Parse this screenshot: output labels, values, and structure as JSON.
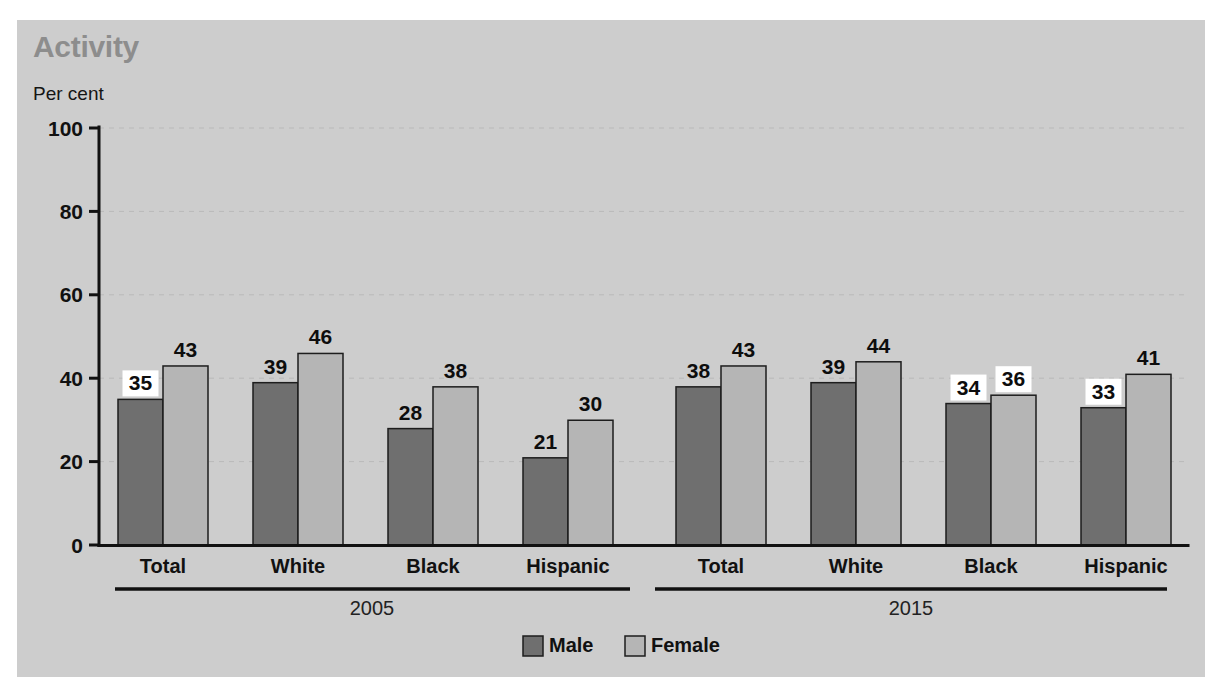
{
  "chart_data": {
    "type": "bar",
    "title": "Activity",
    "subtitle": "",
    "ylabel": "Per cent",
    "xlabel": "",
    "ylim": [
      0,
      100
    ],
    "yticks": [
      0,
      20,
      40,
      60,
      80,
      100
    ],
    "ytick_labels": [
      "0",
      "20",
      "40",
      "60",
      "80",
      "100"
    ],
    "grid": true,
    "grid_axis": "y",
    "legend_position": "bottom-center",
    "categories": [
      "Total",
      "White",
      "Black",
      "Hispanic",
      "Total",
      "White",
      "Black",
      "Hispanic"
    ],
    "groups": [
      {
        "period": "2005",
        "categories": [
          "Total",
          "White",
          "Black",
          "Hispanic"
        ]
      },
      {
        "period": "2015",
        "categories": [
          "Total",
          "White",
          "Black",
          "Hispanic"
        ]
      }
    ],
    "series": [
      {
        "name": "Male",
        "color": "#6f6f6f",
        "values": [
          35,
          39,
          28,
          21,
          38,
          39,
          34,
          33
        ]
      },
      {
        "name": "Female",
        "color": "#b5b5b5",
        "values": [
          43,
          46,
          38,
          30,
          43,
          44,
          36,
          41
        ]
      }
    ],
    "data_labels": [
      {
        "group": 0,
        "category": "Total",
        "period": "2005",
        "series": "Male",
        "value": 35,
        "boxed": true
      },
      {
        "group": 0,
        "category": "Total",
        "period": "2005",
        "series": "Female",
        "value": 43,
        "boxed": false
      },
      {
        "group": 0,
        "category": "White",
        "period": "2005",
        "series": "Male",
        "value": 39,
        "boxed": false
      },
      {
        "group": 0,
        "category": "White",
        "period": "2005",
        "series": "Female",
        "value": 46,
        "boxed": false
      },
      {
        "group": 0,
        "category": "Black",
        "period": "2005",
        "series": "Male",
        "value": 28,
        "boxed": false
      },
      {
        "group": 0,
        "category": "Black",
        "period": "2005",
        "series": "Female",
        "value": 38,
        "boxed": false
      },
      {
        "group": 0,
        "category": "Hispanic",
        "period": "2005",
        "series": "Male",
        "value": 21,
        "boxed": false
      },
      {
        "group": 0,
        "category": "Hispanic",
        "period": "2005",
        "series": "Female",
        "value": 30,
        "boxed": false
      },
      {
        "group": 1,
        "category": "Total",
        "period": "2015",
        "series": "Male",
        "value": 38,
        "boxed": false
      },
      {
        "group": 1,
        "category": "Total",
        "period": "2015",
        "series": "Female",
        "value": 43,
        "boxed": false
      },
      {
        "group": 1,
        "category": "White",
        "period": "2015",
        "series": "Male",
        "value": 39,
        "boxed": false
      },
      {
        "group": 1,
        "category": "White",
        "period": "2015",
        "series": "Female",
        "value": 44,
        "boxed": false
      },
      {
        "group": 1,
        "category": "Black",
        "period": "2015",
        "series": "Male",
        "value": 34,
        "boxed": true
      },
      {
        "group": 1,
        "category": "Black",
        "period": "2015",
        "series": "Female",
        "value": 36,
        "boxed": true
      },
      {
        "group": 1,
        "category": "Hispanic",
        "period": "2015",
        "series": "Male",
        "value": 33,
        "boxed": true
      },
      {
        "group": 1,
        "category": "Hispanic",
        "period": "2015",
        "series": "Female",
        "value": 41,
        "boxed": false
      }
    ],
    "legend": [
      {
        "label": "Male",
        "color": "#6f6f6f"
      },
      {
        "label": "Female",
        "color": "#b5b5b5"
      }
    ],
    "colors": {
      "panel_background": "#cdcdcd",
      "page_background": "#ffffff",
      "title": "#8d8d8d",
      "axis": "#111111",
      "gridline": "#b9b9b9",
      "male_bar": "#6f6f6f",
      "female_bar": "#b5b5b5",
      "bar_outline": "#1d1d1d",
      "label_box": "#ffffff"
    }
  }
}
